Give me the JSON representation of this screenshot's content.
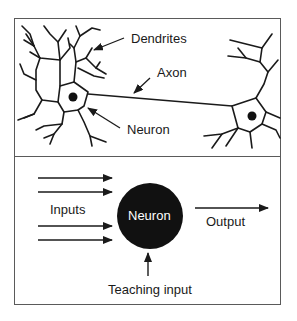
{
  "top_panel": {
    "title": "Biological neuron",
    "labels": {
      "dendrites": "Dendrites",
      "axon": "Axon",
      "neuron": "Neuron"
    }
  },
  "bottom_panel": {
    "title": "Artificial neuron",
    "labels": {
      "inputs": "Inputs",
      "neuron": "Neuron",
      "output": "Output",
      "teaching_input": "Teaching input"
    },
    "input_arrow_count": 4
  },
  "colors": {
    "ink": "#1a1a1a",
    "frame": "#5a5a5a",
    "neuron_fill": "#111111",
    "neuron_text": "#ffffff"
  }
}
